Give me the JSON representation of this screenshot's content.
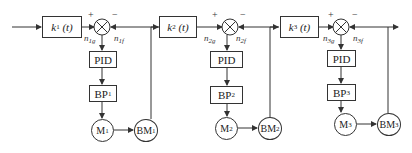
{
  "diagram": {
    "type": "cascaded-speed-control-block-diagram",
    "stages": [
      {
        "gain_block": {
          "symbol": "k",
          "index": "1",
          "arg": "(t)"
        },
        "junction": {
          "plus": "+",
          "minus": "−"
        },
        "set_signal": {
          "symbol": "n",
          "sub": "1g"
        },
        "feedback_signal": {
          "symbol": "n",
          "sub": "1f"
        },
        "controller": "PID",
        "converter": {
          "text": "BP",
          "sub": "1"
        },
        "motor": {
          "text": "M",
          "sub": "1"
        },
        "encoder": {
          "text": "BM",
          "sub": "1"
        }
      },
      {
        "gain_block": {
          "symbol": "k",
          "index": "2",
          "arg": "(t)"
        },
        "junction": {
          "plus": "+",
          "minus": "−"
        },
        "set_signal": {
          "symbol": "n",
          "sub": "2g"
        },
        "feedback_signal": {
          "symbol": "n",
          "sub": "2f"
        },
        "controller": "PID",
        "converter": {
          "text": "BP",
          "sub": "2"
        },
        "motor": {
          "text": "M",
          "sub": "2"
        },
        "encoder": {
          "text": "BM",
          "sub": "2"
        }
      },
      {
        "gain_block": {
          "symbol": "k",
          "index": "3",
          "arg": "(t)"
        },
        "junction": {
          "plus": "+",
          "minus": "−"
        },
        "set_signal": {
          "symbol": "n",
          "sub": "3g"
        },
        "feedback_signal": {
          "symbol": "n",
          "sub": "3f"
        },
        "controller": "PID",
        "converter": {
          "text": "BP",
          "sub": "3"
        },
        "motor": {
          "text": "M",
          "sub": "3"
        },
        "encoder": {
          "text": "BM",
          "sub": "3"
        }
      }
    ],
    "colors": {
      "line": "#333333",
      "background": "#ffffff"
    }
  }
}
